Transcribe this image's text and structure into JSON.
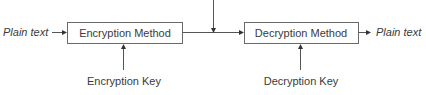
{
  "diagram": {
    "type": "flow",
    "nodes": {
      "input": {
        "label": "Plain text",
        "style": "italic"
      },
      "encryption_method": {
        "label": "Encryption Method"
      },
      "decryption_method": {
        "label": "Decryption Method"
      },
      "output": {
        "label": "Plain text",
        "style": "italic"
      },
      "encryption_key": {
        "label": "Encryption Key"
      },
      "decryption_key": {
        "label": "Decryption Key"
      }
    },
    "edges": [
      {
        "from": "input",
        "to": "encryption_method"
      },
      {
        "from": "encryption_key",
        "to": "encryption_method"
      },
      {
        "from": "encryption_method",
        "to": "decryption_method"
      },
      {
        "from": "external_top",
        "to": "channel_between_methods"
      },
      {
        "from": "decryption_key",
        "to": "decryption_method"
      },
      {
        "from": "decryption_method",
        "to": "output"
      }
    ],
    "colors": {
      "line": "#555555",
      "box_border": "#6a6a6a",
      "text": "#3a3a3a",
      "background": "#ffffff"
    }
  }
}
